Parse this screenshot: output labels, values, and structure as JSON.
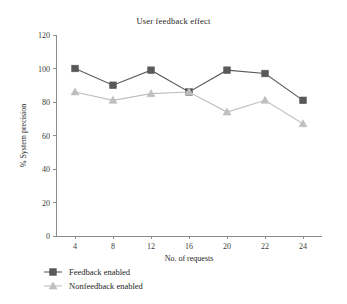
{
  "chart_data": {
    "type": "line",
    "title": "User feedback effect",
    "xlabel": "No. of requests",
    "ylabel": "% System precision",
    "categories": [
      "4",
      "8",
      "12",
      "16",
      "20",
      "22",
      "24"
    ],
    "ylim": [
      0,
      120
    ],
    "yticks": [
      "0",
      "20",
      "40",
      "60",
      "80",
      "100",
      "120"
    ],
    "grid": false,
    "legend_position": "bottom-left",
    "series": [
      {
        "name": "Feedback enabled",
        "marker": "square",
        "color": "#595959",
        "values": [
          100,
          90,
          99,
          86,
          99,
          97,
          81
        ]
      },
      {
        "name": "Nonfeedback enabled",
        "marker": "triangle",
        "color": "#bfbfbf",
        "values": [
          86,
          81,
          85,
          86,
          74,
          81,
          67
        ]
      }
    ]
  }
}
